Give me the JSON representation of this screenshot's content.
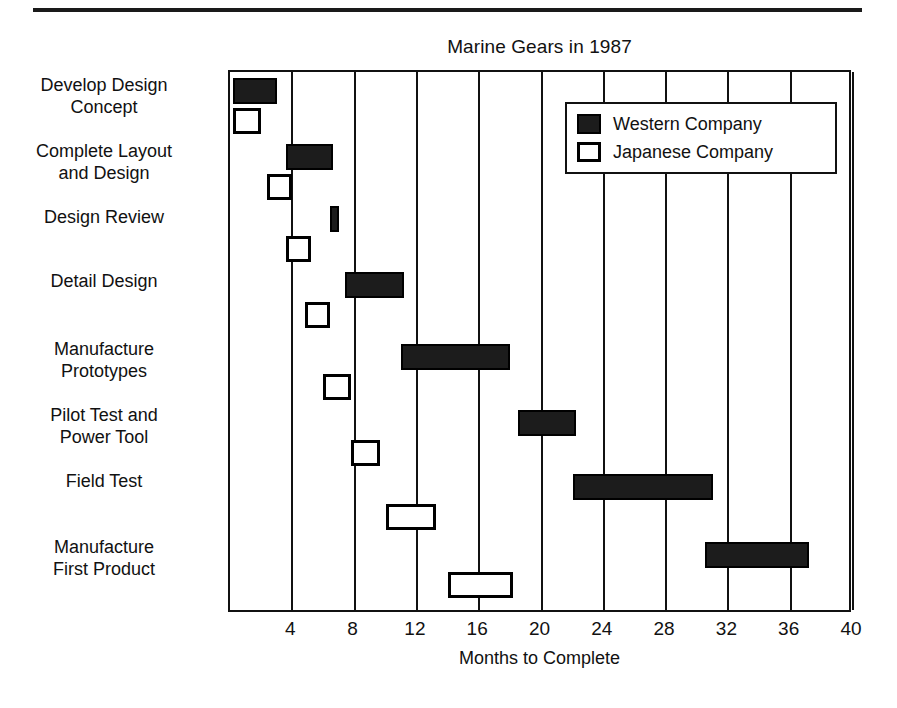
{
  "chart_data": {
    "type": "bar",
    "subtype": "gantt",
    "title": "Marine Gears in 1987",
    "xlabel": "Months to Complete",
    "ylabel": "",
    "xlim": [
      0,
      40
    ],
    "xticks": [
      4,
      8,
      12,
      16,
      20,
      24,
      28,
      32,
      36,
      40
    ],
    "grid": true,
    "grid_axis": "x",
    "legend_position": "top-right",
    "legend": [
      {
        "name": "Western Company",
        "style": "filled",
        "color": "#1c1c1c"
      },
      {
        "name": "Japanese Company",
        "style": "outlined",
        "color": "#ffffff"
      }
    ],
    "categories": [
      "Develop Design Concept",
      "Complete Layout and Design",
      "Design Review",
      "Detail Design",
      "Manufacture Prototypes",
      "Pilot Test and Power Tool",
      "Field Test",
      "Manufacture First Product"
    ],
    "series": [
      {
        "name": "Western Company",
        "bars": [
          {
            "task": "Develop Design Concept",
            "start": 0.2,
            "end": 3.0
          },
          {
            "task": "Complete Layout and Design",
            "start": 3.6,
            "end": 6.6
          },
          {
            "task": "Design Review",
            "start": 6.4,
            "end": 7.0
          },
          {
            "task": "Detail Design",
            "start": 7.4,
            "end": 11.2
          },
          {
            "task": "Manufacture Prototypes",
            "start": 11.0,
            "end": 18.0
          },
          {
            "task": "Pilot Test and Power Tool",
            "start": 18.5,
            "end": 22.2
          },
          {
            "task": "Field Test",
            "start": 22.0,
            "end": 31.0
          },
          {
            "task": "Manufacture First Product",
            "start": 30.5,
            "end": 37.2
          }
        ]
      },
      {
        "name": "Japanese Company",
        "bars": [
          {
            "task": "Develop Design Concept",
            "start": 0.2,
            "end": 2.0
          },
          {
            "task": "Complete Layout and Design",
            "start": 2.4,
            "end": 4.0
          },
          {
            "task": "Design Review",
            "start": 3.6,
            "end": 5.2
          },
          {
            "task": "Detail Design",
            "start": 4.8,
            "end": 6.4
          },
          {
            "task": "Manufacture Prototypes",
            "start": 6.0,
            "end": 7.8
          },
          {
            "task": "Pilot Test and Power Tool",
            "start": 7.8,
            "end": 9.6
          },
          {
            "task": "Field Test",
            "start": 10.0,
            "end": 13.2
          },
          {
            "task": "Manufacture First Product",
            "start": 14.0,
            "end": 18.2
          }
        ]
      }
    ]
  },
  "axis": {
    "tick_labels": [
      "4",
      "8",
      "12",
      "16",
      "20",
      "24",
      "28",
      "32",
      "36",
      "40"
    ],
    "title": "Months to Complete"
  },
  "tasks": [
    {
      "label": "Develop Design\nConcept"
    },
    {
      "label": "Complete Layout\nand Design"
    },
    {
      "label": "Design Review"
    },
    {
      "label": "Detail Design"
    },
    {
      "label": "Manufacture\nPrototypes"
    },
    {
      "label": "Pilot Test and\nPower Tool"
    },
    {
      "label": "Field Test"
    },
    {
      "label": "Manufacture\nFirst Product"
    }
  ],
  "legend": {
    "items": [
      {
        "label": "Western Company"
      },
      {
        "label": "Japanese Company"
      }
    ]
  },
  "header": {
    "title": "Marine Gears in 1987"
  }
}
